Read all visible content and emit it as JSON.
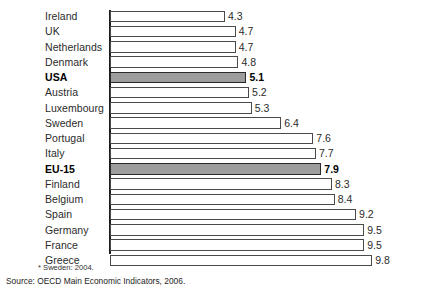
{
  "chart_data": {
    "type": "bar",
    "orientation": "horizontal",
    "title": "",
    "xlabel": "",
    "ylabel": "",
    "grid": false,
    "legend": null,
    "axis_ticks": [],
    "xlim": [
      0,
      9.8
    ],
    "categories": [
      "Ireland",
      "UK",
      "Netherlands",
      "Denmark",
      "USA",
      "Austria",
      "Luxembourg",
      "Sweden",
      "Portugal",
      "Italy",
      "EU-15",
      "Finland",
      "Belgium",
      "Spain",
      "Germany",
      "France",
      "Greece"
    ],
    "values": [
      4.3,
      4.7,
      4.7,
      4.8,
      5.1,
      5.2,
      5.3,
      6.4,
      7.6,
      7.7,
      7.9,
      8.3,
      8.4,
      9.2,
      9.5,
      9.5,
      9.8
    ],
    "value_labels": [
      "4.3",
      "4.7",
      "4.7",
      "4.8",
      "5.1",
      "5.2",
      "5.3",
      "6.4",
      "7.6",
      "7.7",
      "7.9",
      "8.3",
      "8.4",
      "9.2",
      "9.5",
      "9.5",
      "9.8"
    ],
    "highlighted": [
      "USA",
      "EU-15"
    ],
    "colors": {
      "bar_fill": "#ffffff",
      "bar_outline": "#4a4a4a",
      "highlight_fill": "#9d9d9d",
      "highlight_outline": "#2a2a2a",
      "axis": "#1d1d1d",
      "text": "#2b2b2b",
      "background": "#ffffff"
    }
  },
  "footnotes": {
    "note": "* Sweden: 2004.",
    "source": "Source: OECD Main Economic Indicators, 2006."
  }
}
